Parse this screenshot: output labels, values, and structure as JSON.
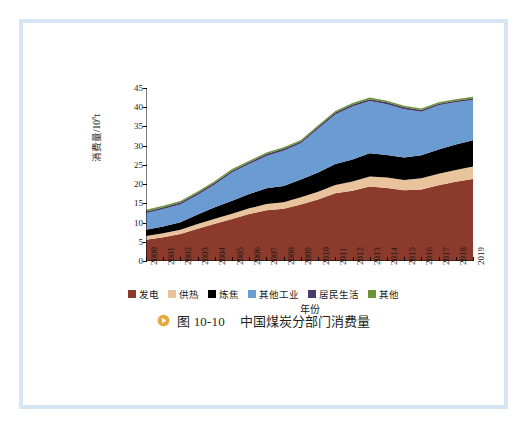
{
  "figure": {
    "caption_icon": "play-circle-icon",
    "caption_number": "图 10-10",
    "caption_text": "中国煤炭分部门消费量"
  },
  "chart_data": {
    "type": "area",
    "stacked": true,
    "title": "",
    "xlabel": "年份",
    "ylabel": "消费量/10⁸t",
    "ylabel_base": "消费量/10",
    "ylabel_exp": "8",
    "ylabel_unit": "t",
    "ylim": [
      0,
      45
    ],
    "yticks": [
      0,
      5,
      10,
      15,
      20,
      25,
      30,
      35,
      40,
      45
    ],
    "grid": false,
    "legend_position": "bottom",
    "categories": [
      "2000",
      "2001",
      "2002",
      "2003",
      "2004",
      "2005",
      "2006",
      "2007",
      "2008",
      "2009",
      "2010",
      "2011",
      "2012",
      "2013",
      "2014",
      "2015",
      "2016",
      "2017",
      "2018",
      "2019"
    ],
    "series": [
      {
        "name": "发电",
        "color": "#8c3a2b",
        "values": [
          5.5,
          6.2,
          7.0,
          8.4,
          9.7,
          10.9,
          12.2,
          13.2,
          13.6,
          14.7,
          16.0,
          17.6,
          18.3,
          19.4,
          19.0,
          18.4,
          18.6,
          19.7,
          20.6,
          21.3
        ]
      },
      {
        "name": "供热",
        "color": "#e9c39c",
        "values": [
          1.0,
          1.0,
          1.1,
          1.2,
          1.3,
          1.4,
          1.5,
          1.6,
          1.7,
          1.9,
          2.0,
          2.2,
          2.4,
          2.6,
          2.7,
          2.7,
          2.9,
          3.0,
          3.1,
          3.3
        ]
      },
      {
        "name": "炼焦",
        "color": "#000000",
        "values": [
          1.6,
          1.8,
          2.0,
          2.5,
          3.0,
          3.4,
          3.7,
          4.1,
          4.2,
          4.6,
          5.0,
          5.4,
          5.7,
          6.0,
          5.9,
          5.8,
          6.0,
          6.3,
          6.6,
          6.8
        ]
      },
      {
        "name": "其他工业",
        "color": "#6a9bd1",
        "values": [
          4.3,
          4.5,
          4.6,
          5.1,
          5.9,
          7.3,
          7.8,
          8.4,
          9.2,
          9.4,
          11.4,
          12.9,
          13.8,
          13.6,
          13.2,
          12.6,
          11.3,
          11.5,
          11.0,
          10.5
        ]
      },
      {
        "name": "居民生活",
        "color": "#4a3a6b",
        "values": [
          0.5,
          0.5,
          0.5,
          0.5,
          0.5,
          0.5,
          0.5,
          0.5,
          0.5,
          0.5,
          0.5,
          0.5,
          0.5,
          0.5,
          0.5,
          0.5,
          0.5,
          0.4,
          0.4,
          0.4
        ]
      },
      {
        "name": "其他",
        "color": "#6a9437",
        "values": [
          0.4,
          0.4,
          0.4,
          0.4,
          0.4,
          0.4,
          0.4,
          0.4,
          0.4,
          0.4,
          0.4,
          0.4,
          0.4,
          0.4,
          0.4,
          0.4,
          0.4,
          0.4,
          0.4,
          0.4
        ]
      }
    ],
    "totals": [
      13.3,
      14.4,
      15.6,
      18.1,
      20.8,
      23.9,
      26.1,
      28.2,
      29.6,
      31.5,
      35.3,
      39.0,
      41.1,
      42.5,
      41.7,
      40.4,
      39.7,
      41.3,
      42.1,
      42.7
    ]
  },
  "colors": {
    "frame": "#d6e6f4",
    "caption_icon": "#e8a93a",
    "axis": "#000000",
    "text": "#1a1a1a"
  }
}
